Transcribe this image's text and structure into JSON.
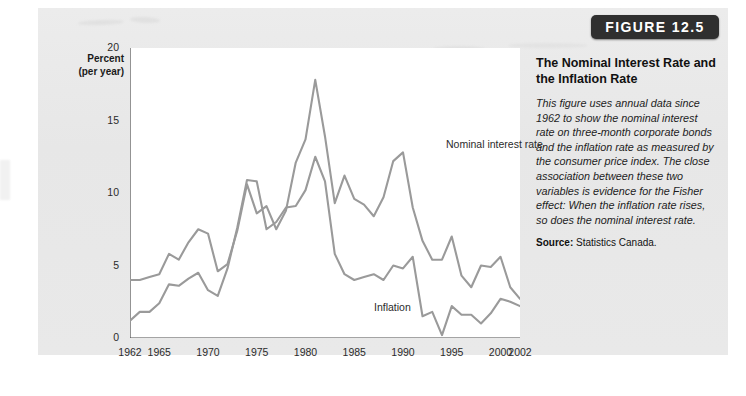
{
  "figure": {
    "badge_label": "FIGURE 12.5"
  },
  "caption": {
    "title": "The Nominal Interest Rate and the Inflation Rate",
    "body": "This figure uses annual data since 1962 to show the nominal interest rate on three-month corporate bonds and the inflation rate as measured by the consumer price index. The close association between these two variables is evidence for the Fisher effect: When the inflation rate rises, so does the nominal interest rate.",
    "source_label": "Source:",
    "source_text": "Statistics Canada."
  },
  "colors": {
    "line": "#9a9a9a",
    "axis": "#4a4a4a",
    "paper": "#e9e9e9",
    "plot_background": "#ffffff",
    "badge_background": "#2f2f2f",
    "badge_text": "#ffffff"
  },
  "chart_data": {
    "type": "line",
    "title": "The Nominal Interest Rate and the Inflation Rate",
    "xlabel": "",
    "ylabel": "Percent (per year)",
    "ylabel_line1": "Percent",
    "ylabel_line2": "(per year)",
    "xlim": [
      1962,
      2002
    ],
    "ylim": [
      0,
      20
    ],
    "yticks": [
      0,
      5,
      10,
      15,
      20
    ],
    "xticks": [
      1962,
      1965,
      1970,
      1975,
      1980,
      1985,
      1990,
      1995,
      2000,
      2002
    ],
    "xtick_labels": [
      "1962",
      "1965",
      "1970",
      "1975",
      "1980",
      "1985",
      "1990",
      "1995",
      "2000",
      "2002"
    ],
    "ytick_labels": [
      "0",
      "5",
      "10",
      "15",
      "20"
    ],
    "grid": false,
    "legend": "in-plot labels",
    "x": [
      1962,
      1963,
      1964,
      1965,
      1966,
      1967,
      1968,
      1969,
      1970,
      1971,
      1972,
      1973,
      1974,
      1975,
      1976,
      1977,
      1978,
      1979,
      1980,
      1981,
      1982,
      1983,
      1984,
      1985,
      1986,
      1987,
      1988,
      1989,
      1990,
      1991,
      1992,
      1993,
      1994,
      1995,
      1996,
      1997,
      1998,
      1999,
      2000,
      2001,
      2002
    ],
    "series": [
      {
        "name": "Nominal interest rate",
        "label": "Nominal interest rate",
        "color": "#9a9a9a",
        "values": [
          4.0,
          4.0,
          4.2,
          4.4,
          5.8,
          5.4,
          6.6,
          7.5,
          7.2,
          4.6,
          5.1,
          7.4,
          10.6,
          8.6,
          9.1,
          7.5,
          8.8,
          12.1,
          13.7,
          17.8,
          13.9,
          9.3,
          11.2,
          9.6,
          9.2,
          8.4,
          9.7,
          12.2,
          12.8,
          9.0,
          6.7,
          5.4,
          5.4,
          7.0,
          4.3,
          3.5,
          5.0,
          4.9,
          5.6,
          3.5,
          2.7
        ]
      },
      {
        "name": "Inflation",
        "label": "Inflation",
        "color": "#9a9a9a",
        "values": [
          1.2,
          1.8,
          1.8,
          2.4,
          3.7,
          3.6,
          4.1,
          4.5,
          3.3,
          2.9,
          4.8,
          7.6,
          10.9,
          10.8,
          7.5,
          8.0,
          9.0,
          9.1,
          10.2,
          12.5,
          10.8,
          5.8,
          4.4,
          4.0,
          4.2,
          4.4,
          4.0,
          5.0,
          4.8,
          5.6,
          1.5,
          1.8,
          0.2,
          2.2,
          1.6,
          1.6,
          1.0,
          1.7,
          2.7,
          2.5,
          2.2
        ]
      }
    ]
  }
}
